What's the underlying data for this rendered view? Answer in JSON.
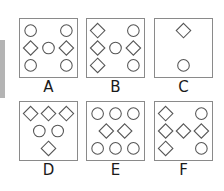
{
  "figure": {
    "options": [
      {
        "label": "A",
        "rows": [
          [
            "circle",
            "",
            "circle"
          ],
          [
            "diamond",
            "circle",
            "diamond"
          ],
          [
            "circle",
            "",
            "circle"
          ]
        ]
      },
      {
        "label": "B",
        "rows": [
          [
            "diamond",
            "",
            "circle"
          ],
          [
            "diamond",
            "circle",
            "diamond"
          ],
          [
            "diamond",
            "",
            "circle"
          ]
        ]
      },
      {
        "label": "C",
        "rows": [
          [
            "",
            "diamond",
            ""
          ],
          [
            "",
            "",
            ""
          ],
          [
            "",
            "circle",
            ""
          ]
        ]
      },
      {
        "label": "D",
        "rows": [
          [
            "diamond",
            "diamond",
            "diamond"
          ],
          [
            "circle",
            "",
            "circle"
          ],
          [
            "",
            "diamond",
            ""
          ]
        ]
      },
      {
        "label": "E",
        "rows": [
          [
            "circle",
            "circle",
            "circle"
          ],
          [
            "diamond",
            "",
            "diamond"
          ],
          [
            "circle",
            "circle",
            "circle"
          ]
        ]
      },
      {
        "label": "F",
        "rows": [
          [
            "diamond",
            "",
            "circle"
          ],
          [
            "diamond",
            "diamond",
            "diamond"
          ],
          [
            "diamond",
            "",
            "circle"
          ]
        ]
      }
    ],
    "stroke_color": "#555555"
  }
}
